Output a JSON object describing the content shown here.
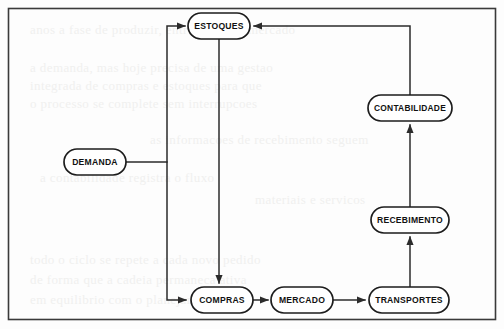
{
  "diagram": {
    "type": "flowchart",
    "language": "pt-BR",
    "frame": {
      "stroke": "#3a3a3a"
    },
    "colors": {
      "node_fill": "#ffffff",
      "node_stroke": "#1d1d1d",
      "link_stroke": "#2b2b2b",
      "label_text": "#111111",
      "background": "#fdfdfd"
    },
    "nodes": [
      {
        "id": "estoques",
        "label": "ESTOQUES",
        "cx": 219,
        "cy": 26,
        "w": 62,
        "h": 26
      },
      {
        "id": "demanda",
        "label": "DEMANDA",
        "cx": 95,
        "cy": 162,
        "w": 62,
        "h": 26
      },
      {
        "id": "contabilidade",
        "label": "CONTABILIDADE",
        "cx": 410,
        "cy": 108,
        "w": 84,
        "h": 26
      },
      {
        "id": "recebimento",
        "label": "RECEBIMENTO",
        "cx": 410,
        "cy": 220,
        "w": 78,
        "h": 26
      },
      {
        "id": "compras",
        "label": "COMPRAS",
        "cx": 222,
        "cy": 300,
        "w": 62,
        "h": 26
      },
      {
        "id": "mercado",
        "label": "MERCADO",
        "cx": 302,
        "cy": 300,
        "w": 62,
        "h": 26
      },
      {
        "id": "transportes",
        "label": "TRANSPORTES",
        "cx": 409,
        "cy": 300,
        "w": 80,
        "h": 26
      }
    ],
    "edges": [
      {
        "id": "estoques-compras",
        "from": "estoques",
        "to": "compras",
        "arrow": "end"
      },
      {
        "id": "demanda-compras",
        "from": "demanda",
        "to": "compras",
        "arrow": "end"
      },
      {
        "id": "demanda-estoques",
        "from": "demanda",
        "to": "estoques",
        "arrow": "end"
      },
      {
        "id": "compras-mercado",
        "from": "compras",
        "to": "mercado",
        "arrow": "end"
      },
      {
        "id": "mercado-transportes",
        "from": "mercado",
        "to": "transportes",
        "arrow": "end"
      },
      {
        "id": "transportes-recebimento",
        "from": "transportes",
        "to": "recebimento",
        "arrow": "end"
      },
      {
        "id": "recebimento-contabilidade",
        "from": "recebimento",
        "to": "contabilidade",
        "arrow": "end"
      },
      {
        "id": "contabilidade-estoques",
        "from": "contabilidade",
        "to": "estoques",
        "arrow": "end"
      }
    ],
    "bleed_text": [
      {
        "x": 30,
        "y": 22,
        "text": "anos a fase de produzir, entregando ao mercado"
      },
      {
        "x": 30,
        "y": 60,
        "text": "a demanda, mas hoje precisa de uma gestao"
      },
      {
        "x": 30,
        "y": 78,
        "text": "integrada de compras e estoques para que"
      },
      {
        "x": 30,
        "y": 96,
        "text": "o processo se complete sem interrupcoes"
      },
      {
        "x": 150,
        "y": 132,
        "text": "as informacoes de recebimento seguem"
      },
      {
        "x": 40,
        "y": 170,
        "text": "a contabilidade registra o fluxo"
      },
      {
        "x": 255,
        "y": 192,
        "text": "materiais e servicos"
      },
      {
        "x": 30,
        "y": 252,
        "text": "todo o ciclo se repete a cada novo pedido"
      },
      {
        "x": 30,
        "y": 272,
        "text": "de forma que a cadeia permaneca ativa"
      },
      {
        "x": 30,
        "y": 292,
        "text": "em equilibrio com o planejamento"
      }
    ]
  }
}
